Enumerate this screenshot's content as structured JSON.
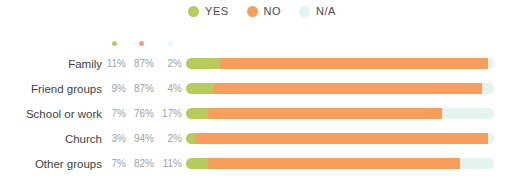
{
  "legend": {
    "items": [
      {
        "label": "YES",
        "color": "#b5cc5b",
        "icon": "legend-dot-yes"
      },
      {
        "label": "NO",
        "color": "#f89d5c",
        "icon": "legend-dot-no"
      },
      {
        "label": "N/A",
        "color": "#e3f4ef",
        "icon": "legend-dot-na"
      }
    ]
  },
  "column_dots": [
    {
      "color": "#b5cc5b",
      "icon": "column-dot-yes"
    },
    {
      "color": "#f0a07a",
      "icon": "column-dot-no"
    },
    {
      "color": "#eef6f3",
      "icon": "column-dot-na"
    }
  ],
  "rows": [
    {
      "label": "Family",
      "yes": "11%",
      "no": "87%",
      "na": "2%",
      "yes_value": 11,
      "no_value": 87,
      "na_value": 2
    },
    {
      "label": "Friend groups",
      "yes": "9%",
      "no": "87%",
      "na": "4%",
      "yes_value": 9,
      "no_value": 87,
      "na_value": 4
    },
    {
      "label": "School or work",
      "yes": "7%",
      "no": "76%",
      "na": "17%",
      "yes_value": 7,
      "no_value": 76,
      "na_value": 17
    },
    {
      "label": "Church",
      "yes": "3%",
      "no": "94%",
      "na": "2%",
      "yes_value": 3,
      "no_value": 94,
      "na_value": 2
    },
    {
      "label": "Other groups",
      "yes": "7%",
      "no": "82%",
      "na": "11%",
      "yes_value": 7,
      "no_value": 82,
      "na_value": 11
    }
  ],
  "colors": {
    "yes": "#b5cc5b",
    "no": "#f89d5c",
    "na": "#e3f4ef",
    "label_text": "#3f3f3f",
    "pct_text": "#a2a2a2",
    "background": "#ffffff"
  },
  "chart_data": {
    "type": "bar",
    "title": "",
    "subtitle": "",
    "xlabel": "",
    "ylabel": "",
    "orientation": "horizontal",
    "stacked": true,
    "normalized": true,
    "grid": false,
    "legend_position": "top-center",
    "xlim": [
      0,
      100
    ],
    "units": "percent",
    "categories": [
      "Family",
      "Friend groups",
      "School or work",
      "Church",
      "Other groups"
    ],
    "series": [
      {
        "name": "YES",
        "color": "#b5cc5b",
        "values": [
          11,
          9,
          7,
          3,
          7
        ]
      },
      {
        "name": "NO",
        "color": "#f89d5c",
        "values": [
          87,
          87,
          76,
          94,
          82
        ]
      },
      {
        "name": "N/A",
        "color": "#e3f4ef",
        "values": [
          2,
          4,
          17,
          2,
          11
        ]
      }
    ],
    "data_labels": [
      {
        "category": "Family",
        "YES": "11%",
        "NO": "87%",
        "N/A": "2%"
      },
      {
        "category": "Friend groups",
        "YES": "9%",
        "NO": "87%",
        "N/A": "4%"
      },
      {
        "category": "School or work",
        "YES": "7%",
        "NO": "76%",
        "N/A": "17%"
      },
      {
        "category": "Church",
        "YES": "3%",
        "NO": "94%",
        "N/A": "2%"
      },
      {
        "category": "Other groups",
        "YES": "7%",
        "NO": "82%",
        "N/A": "11%"
      }
    ]
  }
}
